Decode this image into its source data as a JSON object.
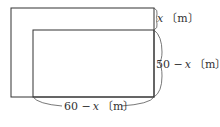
{
  "diagram": {
    "labels": {
      "top_right": {
        "var": "x",
        "unit": "〔m〕"
      },
      "right": {
        "num": "50 −",
        "var": "x",
        "unit": "〔m〕"
      },
      "bottom": {
        "num": "60 −",
        "var": "x",
        "unit": "〔m〕"
      }
    },
    "colors": {
      "stroke": "#333333",
      "background": "#ffffff"
    }
  }
}
